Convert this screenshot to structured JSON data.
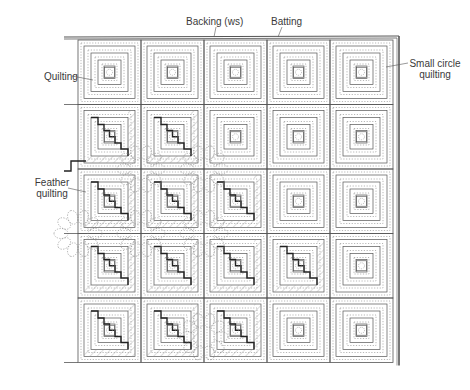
{
  "figure": {
    "type": "log-cabin quilt technical drawing",
    "grid": {
      "rows": 5,
      "cols": 5
    },
    "colors": {
      "line": "#555555",
      "dark_line": "#222222",
      "dotted": "#888888",
      "hatch": "#999999",
      "feather": "#8a8a8a",
      "label": "#3a3a3a"
    }
  },
  "labels": {
    "backing": "Backing (ws)",
    "batting": "Batting",
    "quilting": "Quilting",
    "small_circle_line1": "Small circle",
    "small_circle_line2": "quilting",
    "feather_line1": "Feather",
    "feather_line2": "quilting"
  },
  "dark_blocks": [
    [
      1,
      0
    ],
    [
      1,
      1
    ],
    [
      2,
      0
    ],
    [
      2,
      1
    ],
    [
      2,
      2
    ],
    [
      3,
      0
    ],
    [
      3,
      1
    ],
    [
      3,
      2
    ],
    [
      3,
      3
    ],
    [
      4,
      0
    ],
    [
      4,
      1
    ],
    [
      4,
      2
    ]
  ]
}
